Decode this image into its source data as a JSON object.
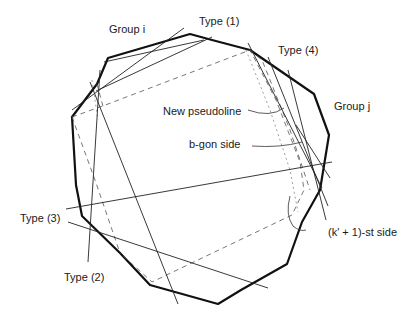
{
  "figure": {
    "labels": {
      "group_i": "Group i",
      "group_j": "Group j",
      "type1": "Type (1)",
      "type2": "Type (2)",
      "type3": "Type (3)",
      "type4": "Type (4)",
      "new_pseudoline": "New pseudoline",
      "bgon_side": "b-gon side",
      "k1_side": "(k' + 1)-st side"
    },
    "colors": {
      "polygon": "#111111",
      "lines": "#222222",
      "dashed": "#555555",
      "background": "#ffffff"
    }
  }
}
